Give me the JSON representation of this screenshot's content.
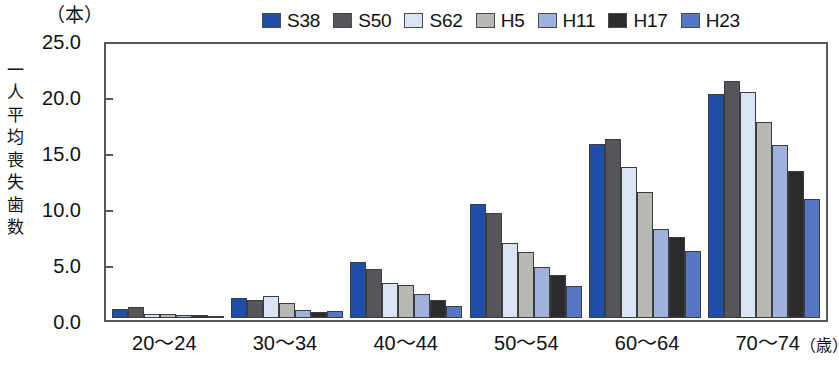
{
  "chart_data": {
    "type": "bar",
    "title": "",
    "subtitle": "",
    "xlabel": "",
    "ylabel": "一人平均喪失歯数",
    "y_unit": "（本）",
    "x_unit": "（歳）",
    "ylim": [
      0,
      25
    ],
    "ytick_values": [
      0,
      5,
      10,
      15,
      20,
      25
    ],
    "ytick_labels": [
      "0.0",
      "5.0",
      "10.0",
      "15.0",
      "20.0",
      "25.0"
    ],
    "grid": false,
    "legend_position": "top-right",
    "categories": [
      "20～24",
      "30～34",
      "40～44",
      "50～54",
      "60～64",
      "70～74"
    ],
    "series": [
      {
        "name": "S38",
        "color": "#1f4fa8",
        "values": [
          0.8,
          1.8,
          5.1,
          10.3,
          15.8,
          20.3
        ]
      },
      {
        "name": "S50",
        "color": "#56565a",
        "values": [
          1.0,
          1.6,
          4.4,
          9.5,
          16.2,
          21.5
        ]
      },
      {
        "name": "S62",
        "color": "#dbe4f2",
        "values": [
          0.4,
          2.0,
          3.2,
          6.8,
          13.7,
          20.5
        ]
      },
      {
        "name": "H5",
        "color": "#b7b9b4",
        "values": [
          0.4,
          1.4,
          3.0,
          6.0,
          11.4,
          17.8
        ]
      },
      {
        "name": "H11",
        "color": "#9fb2dd",
        "values": [
          0.3,
          0.7,
          2.2,
          4.6,
          8.1,
          15.7
        ]
      },
      {
        "name": "H17",
        "color": "#2b2b2e",
        "values": [
          0.3,
          0.5,
          1.6,
          3.9,
          7.3,
          13.3
        ]
      },
      {
        "name": "H23",
        "color": "#5577c4",
        "values": [
          0.2,
          0.6,
          1.1,
          2.9,
          6.1,
          10.8
        ]
      }
    ]
  },
  "caption": ""
}
